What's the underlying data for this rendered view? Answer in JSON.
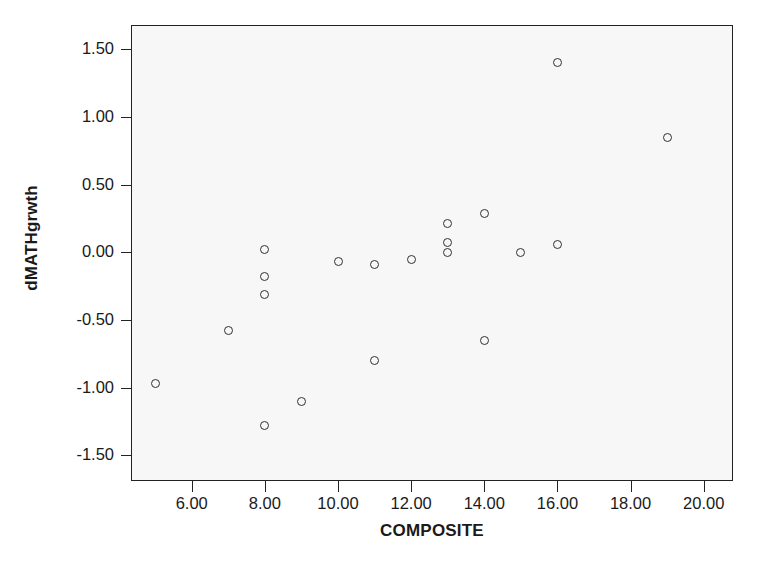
{
  "chart_data": {
    "type": "scatter",
    "title": "",
    "xlabel": "COMPOSITE",
    "ylabel": "dMATHgrwth",
    "xlim": [
      4.34,
      20.8
    ],
    "ylim": [
      -1.69,
      1.68
    ],
    "grid": false,
    "legend": null,
    "marker": "open-circle",
    "xticks": [
      6,
      8,
      10,
      12,
      14,
      16,
      18,
      20
    ],
    "xtick_labels": [
      "6.00",
      "8.00",
      "10.00",
      "12.00",
      "14.00",
      "16.00",
      "18.00",
      "20.00"
    ],
    "yticks": [
      1.5,
      1.0,
      0.5,
      0.0,
      -0.5,
      -1.0,
      -1.5
    ],
    "ytick_labels": [
      "1.50",
      "1.00",
      "0.50",
      "0.00",
      "-0.50",
      "-1.00",
      "-1.50"
    ],
    "points": [
      {
        "x": 5,
        "y": -0.97
      },
      {
        "x": 7,
        "y": -0.58
      },
      {
        "x": 8,
        "y": 0.02
      },
      {
        "x": 8,
        "y": -0.18
      },
      {
        "x": 8,
        "y": -0.31
      },
      {
        "x": 8,
        "y": -1.28
      },
      {
        "x": 9,
        "y": -1.1
      },
      {
        "x": 10,
        "y": -0.07
      },
      {
        "x": 11,
        "y": -0.09
      },
      {
        "x": 11,
        "y": -0.8
      },
      {
        "x": 12,
        "y": -0.05
      },
      {
        "x": 13,
        "y": 0.21
      },
      {
        "x": 13,
        "y": 0.07
      },
      {
        "x": 13,
        "y": 0.0
      },
      {
        "x": 14,
        "y": 0.29
      },
      {
        "x": 14,
        "y": -0.65
      },
      {
        "x": 15,
        "y": 0.0
      },
      {
        "x": 16,
        "y": 1.4
      },
      {
        "x": 16,
        "y": 0.06
      },
      {
        "x": 19,
        "y": 0.85
      }
    ],
    "colors": {
      "marker_stroke": "#303030",
      "axis": "#222222",
      "plot_background": "#f7f7f7",
      "figure_background": "#ffffff",
      "text": "#1a1a1a"
    }
  }
}
